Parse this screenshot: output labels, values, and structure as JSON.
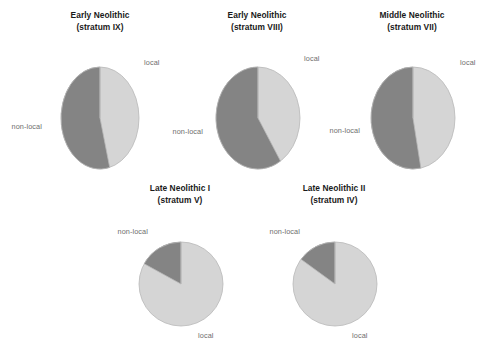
{
  "figure": {
    "background_color": "#ffffff",
    "local_color": "#d5d5d5",
    "nonlocal_color": "#848484",
    "stroke_color": "#b8b8b8",
    "label_color": "#6e6e6e",
    "title_color": "#1a1a1a"
  },
  "panels": [
    {
      "id": "early-neolithic-stratum-ix",
      "title_line1": "Early Neolithic",
      "title_line2": "(stratum IX)",
      "local_label": "local",
      "nonlocal_label": "non-local"
    },
    {
      "id": "early-neolithic-stratum-viii",
      "title_line1": "Early Neolithic",
      "title_line2": "(stratum VIII)",
      "local_label": "local",
      "nonlocal_label": "non-local"
    },
    {
      "id": "middle-neolithic-stratum-vii",
      "title_line1": "Middle Neolithic",
      "title_line2": "(stratum VII)",
      "local_label": "local",
      "nonlocal_label": "non-local"
    },
    {
      "id": "late-neolithic-i-stratum-v",
      "title_line1": "Late Neolithic I",
      "title_line2": "(stratum V)",
      "local_label": "local",
      "nonlocal_label": "non-local"
    },
    {
      "id": "late-neolithic-ii-stratum-iv",
      "title_line1": "Late Neolithic II",
      "title_line2": "(stratum IV)",
      "local_label": "local",
      "nonlocal_label": "non-local"
    }
  ],
  "chart_data": [
    {
      "type": "pie",
      "title": "Early Neolithic (stratum IX)",
      "categories": [
        "local",
        "non-local"
      ],
      "values": [
        46,
        54
      ],
      "units": "percent",
      "start_angle_deg": 0,
      "direction": "clockwise",
      "colors": [
        "#d5d5d5",
        "#848484"
      ],
      "legend": "inline-labels",
      "grid": false
    },
    {
      "type": "pie",
      "title": "Early Neolithic (stratum VIII)",
      "categories": [
        "local",
        "non-local"
      ],
      "values": [
        41,
        59
      ],
      "units": "percent",
      "start_angle_deg": 0,
      "direction": "clockwise",
      "colors": [
        "#d5d5d5",
        "#848484"
      ],
      "legend": "inline-labels",
      "grid": false
    },
    {
      "type": "pie",
      "title": "Middle Neolithic (stratum VII)",
      "categories": [
        "local",
        "non-local"
      ],
      "values": [
        47,
        53
      ],
      "units": "percent",
      "start_angle_deg": 0,
      "direction": "clockwise",
      "colors": [
        "#d5d5d5",
        "#848484"
      ],
      "legend": "inline-labels",
      "grid": false
    },
    {
      "type": "pie",
      "title": "Late Neolithic I (stratum V)",
      "categories": [
        "local",
        "non-local"
      ],
      "values": [
        83,
        17
      ],
      "units": "percent",
      "start_angle_deg": 0,
      "direction": "clockwise",
      "colors": [
        "#d5d5d5",
        "#848484"
      ],
      "legend": "inline-labels",
      "grid": false
    },
    {
      "type": "pie",
      "title": "Late Neolithic II (stratum IV)",
      "categories": [
        "local",
        "non-local"
      ],
      "values": [
        85,
        15
      ],
      "units": "percent",
      "start_angle_deg": 0,
      "direction": "clockwise",
      "colors": [
        "#d5d5d5",
        "#848484"
      ],
      "legend": "inline-labels",
      "grid": false
    }
  ]
}
